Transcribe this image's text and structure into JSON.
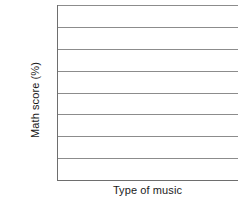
{
  "chart_data": {
    "type": "bar",
    "title": "",
    "subtitle": "",
    "xlabel": "Type of music",
    "ylabel": "Math score (%)",
    "categories": [],
    "values": [],
    "series": [],
    "x_tick_labels": [],
    "y_tick_labels": [],
    "ylim": [
      0,
      7
    ],
    "grid": true,
    "grid_orientation": "horizontal",
    "gridline_count": 7,
    "legend": null,
    "legend_position": "none",
    "annotations": [],
    "note": "blank chart template — axes and horizontal gridlines drawn, no data series plotted"
  },
  "figure": {
    "background_color": "#ffffff",
    "gridline_color": "#8c8c8c",
    "axis_color": "#6e6e6e",
    "text_color": "#1b1b1b"
  },
  "axes": {
    "y_title": "Math score (%)",
    "x_title": "Type of music"
  }
}
